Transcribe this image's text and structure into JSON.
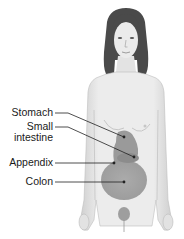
{
  "figure": {
    "colors": {
      "skin": "#e9e9e9",
      "skin_shadow": "#c9c9c9",
      "hair": "#4a4a4a",
      "organ_stomach": "#9a9a9a",
      "organ_colon": "#a3a3a3",
      "organ_small_intestine": "#8c8c8c",
      "leader_line": "#222222"
    }
  },
  "labels": [
    {
      "id": "stomach",
      "text": "Stomach"
    },
    {
      "id": "small-intestine",
      "line1": "Small",
      "line2": "intestine"
    },
    {
      "id": "appendix",
      "text": "Appendix"
    },
    {
      "id": "colon",
      "text": "Colon"
    }
  ]
}
